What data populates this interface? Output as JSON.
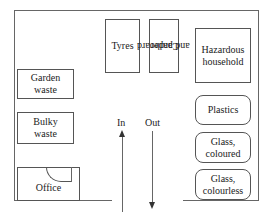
{
  "diagram": {
    "areas": {
      "tyres": "Tyres",
      "cardboard_line1": "Cardboard",
      "cardboard_line2": "and paper",
      "hazardous_line1": "Hazardous",
      "hazardous_line2": "household",
      "garden_line1": "Garden",
      "garden_line2": "waste",
      "bulky_line1": "Bulky",
      "bulky_line2": "waste",
      "plastics": "Plastics",
      "glass_coloured_line1": "Glass,",
      "glass_coloured_line2": "coloured",
      "glass_colourless_line1": "Glass,",
      "glass_colourless_line2": "colourless",
      "office": "Office"
    },
    "arrows": {
      "in": "In",
      "out": "Out"
    }
  }
}
